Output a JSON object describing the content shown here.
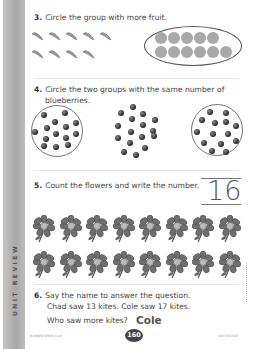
{
  "side_strip": {
    "label": "UNIT REVIEW"
  },
  "questions": [
    {
      "number": "3.",
      "text": "Circle the group with more fruit.",
      "groups": [
        {
          "fruit": "banana",
          "count": 9,
          "circled": false
        },
        {
          "fruit": "orange",
          "count": 11,
          "circled": true
        }
      ]
    },
    {
      "number": "4.",
      "line1": "Circle the two groups with the same number of",
      "line2": "blueberries.",
      "groups": [
        {
          "count": 14,
          "circled": true
        },
        {
          "count": 16,
          "circled": false
        },
        {
          "count": 14,
          "circled": true
        }
      ]
    },
    {
      "number": "5.",
      "text": "Count the flowers and write the number.",
      "answer": "16",
      "flower_count": 16
    },
    {
      "number": "6.",
      "line1": "Say the name to answer the question.",
      "line2": "Chad saw 13 kites. Cole saw 17 kites.",
      "line3": "Who saw more kites?",
      "answer": "Cole"
    }
  ],
  "footer": {
    "left": "NUMBER SENSE 0-20",
    "page": "160",
    "right": "UNIT REVIEW"
  },
  "colors": {
    "strip": "#b9b9b9",
    "text": "#444444",
    "fruit": "#a9a9a9",
    "berry": "#333333"
  }
}
